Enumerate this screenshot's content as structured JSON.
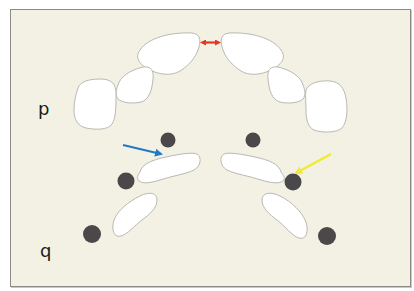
{
  "figure": {
    "labels": {
      "upper": "p",
      "lower": "q"
    },
    "colors": {
      "background": "#f3f1e3",
      "frame_border": "#8a8a86",
      "tooth_fill": "#ffffff",
      "tooth_stroke": "#b9b9b4",
      "dot": "#4a4848",
      "gap_arrow": "#e0391f",
      "blue_arrow": "#1f7ac6",
      "yellow_arrow": "#f2ea2e"
    },
    "annotations": [
      {
        "type": "double-arrow",
        "color": "red",
        "meaning": "gap between central upper teeth"
      },
      {
        "type": "arrow",
        "color": "blue",
        "points_to": "left upper curved segment near dark dot"
      },
      {
        "type": "arrow",
        "color": "yellow",
        "points_to": "right dark dot at end of curved segment"
      }
    ],
    "dark_dots_count": 6,
    "upper_teeth_count": 6,
    "lower_segments_count": 4
  }
}
